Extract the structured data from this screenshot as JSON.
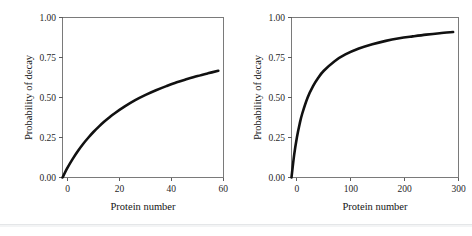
{
  "figure": {
    "background_color": "#ffffff",
    "curve_color": "#111111",
    "frame_color": "#7a7a7a",
    "divider_color": "#e4e6e8"
  },
  "chart_data": [
    {
      "type": "line",
      "panel": "left",
      "title": "",
      "xlabel": "Protein number",
      "ylabel": "Probability of decay",
      "xlim": [
        0,
        62
      ],
      "ylim": [
        0.0,
        1.0
      ],
      "xticks": [
        0,
        20,
        40,
        60
      ],
      "xticklabels": [
        "0",
        "20",
        "40",
        "60"
      ],
      "yticks": [
        0.0,
        0.25,
        0.5,
        0.75,
        1.0
      ],
      "yticklabels": [
        "0.00",
        "0.25",
        "0.50",
        "0.75",
        "1.00"
      ],
      "grid": false,
      "legend": false,
      "x": [
        0,
        2,
        4,
        6,
        8,
        10,
        12,
        14,
        16,
        18,
        20,
        24,
        28,
        32,
        36,
        40,
        44,
        48,
        52,
        56,
        60
      ],
      "y": [
        0.0,
        0.063,
        0.118,
        0.167,
        0.211,
        0.25,
        0.286,
        0.318,
        0.348,
        0.375,
        0.4,
        0.444,
        0.483,
        0.516,
        0.545,
        0.571,
        0.595,
        0.615,
        0.634,
        0.651,
        0.667
      ]
    },
    {
      "type": "line",
      "panel": "right",
      "title": "",
      "xlabel": "Protein number",
      "ylabel": "Probability of decay",
      "xlim": [
        0,
        310
      ],
      "ylim": [
        0.0,
        1.0
      ],
      "xticks": [
        0,
        100,
        200,
        300
      ],
      "xticklabels": [
        "0",
        "100",
        "200",
        "300"
      ],
      "yticks": [
        0.0,
        0.25,
        0.5,
        0.75,
        1.0
      ],
      "yticklabels": [
        "0.00",
        "0.25",
        "0.50",
        "0.75",
        "1.00"
      ],
      "grid": false,
      "legend": false,
      "x": [
        0,
        5,
        10,
        15,
        20,
        30,
        40,
        50,
        60,
        80,
        100,
        125,
        150,
        175,
        200,
        225,
        250,
        275,
        300
      ],
      "y": [
        0.0,
        0.143,
        0.25,
        0.333,
        0.4,
        0.5,
        0.571,
        0.625,
        0.667,
        0.727,
        0.769,
        0.806,
        0.833,
        0.854,
        0.87,
        0.882,
        0.893,
        0.902,
        0.909
      ]
    }
  ]
}
